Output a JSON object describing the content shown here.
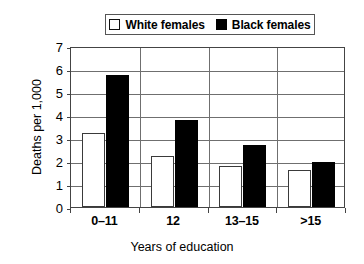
{
  "chart_data": {
    "type": "bar",
    "title": "",
    "xlabel": "Years of education",
    "ylabel": "Deaths per 1,000",
    "categories": [
      "0–11",
      "12",
      "13–15",
      ">15"
    ],
    "series": [
      {
        "name": "White females",
        "color": "#ffffff",
        "values": [
          3.2,
          2.2,
          1.8,
          1.6
        ]
      },
      {
        "name": "Black females",
        "color": "#000000",
        "values": [
          5.75,
          3.8,
          2.7,
          1.95
        ]
      }
    ],
    "ylim": [
      0,
      7
    ],
    "yticks": [
      0,
      1,
      2,
      3,
      4,
      5,
      6,
      7
    ],
    "ytick_labels": [
      "0",
      "1",
      "2",
      "3",
      "4",
      "5",
      "6",
      "7"
    ],
    "grid": true,
    "grid_axis": "y",
    "legend_position": "top-center"
  },
  "legend": {
    "entries": [
      {
        "label": "White females",
        "swatch": "white-square"
      },
      {
        "label": "Black females",
        "swatch": "black-square"
      }
    ]
  },
  "axes": {
    "y_title": "Deaths per 1,000",
    "x_title": "Years of education"
  }
}
